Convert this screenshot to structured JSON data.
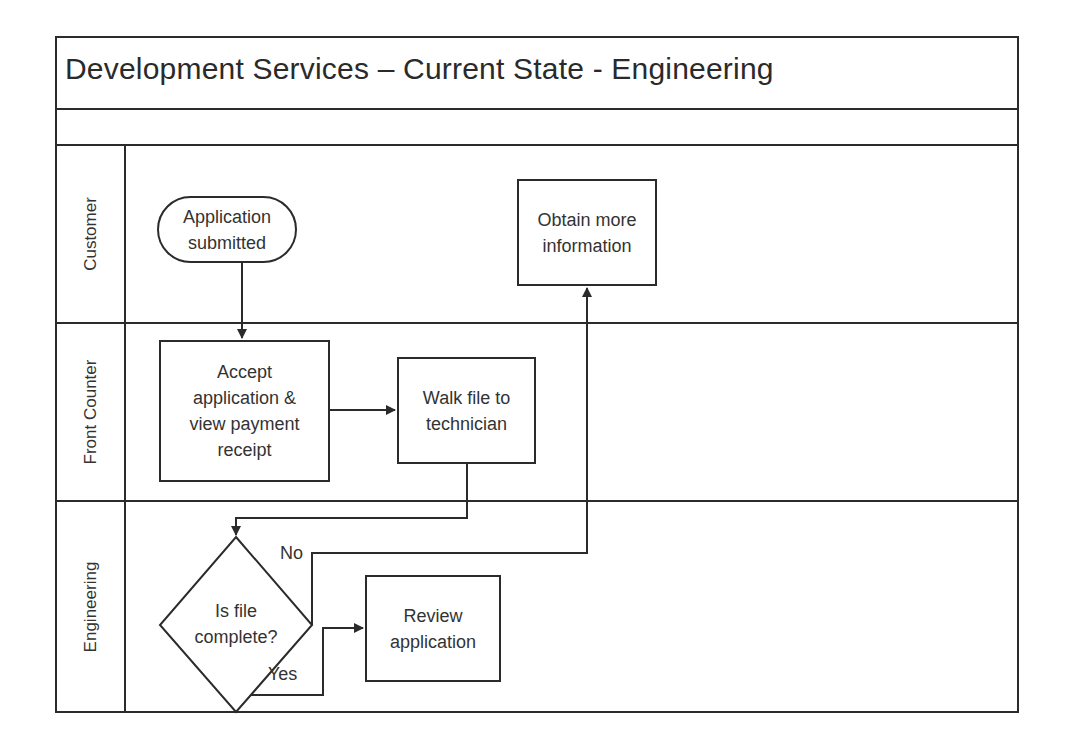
{
  "diagram": {
    "title": "Development Services – Current State - Engineering",
    "type": "swimlane-flowchart",
    "lanes": [
      {
        "id": "customer",
        "label": "Customer"
      },
      {
        "id": "front_counter",
        "label": "Front Counter"
      },
      {
        "id": "engineering",
        "label": "Engineering"
      }
    ],
    "nodes": {
      "start": {
        "lane": "customer",
        "shape": "terminator",
        "label": "Application\nsubmitted"
      },
      "accept": {
        "lane": "front_counter",
        "shape": "process",
        "label": "Accept\napplication &\nview payment\nreceipt"
      },
      "walk": {
        "lane": "front_counter",
        "shape": "process",
        "label": "Walk file to\ntechnician"
      },
      "decision": {
        "lane": "engineering",
        "shape": "decision",
        "label": "Is file\ncomplete?"
      },
      "obtain": {
        "lane": "customer",
        "shape": "process",
        "label": "Obtain more\ninformation"
      },
      "review": {
        "lane": "engineering",
        "shape": "process",
        "label": "Review\napplication"
      }
    },
    "edges": [
      {
        "from": "start",
        "to": "accept",
        "label": ""
      },
      {
        "from": "accept",
        "to": "walk",
        "label": ""
      },
      {
        "from": "walk",
        "to": "decision",
        "label": ""
      },
      {
        "from": "decision",
        "to": "obtain",
        "label": "No"
      },
      {
        "from": "decision",
        "to": "review",
        "label": "Yes"
      }
    ],
    "edge_labels": {
      "no": "No",
      "yes": "Yes"
    },
    "colors": {
      "stroke": "#2b2b2b",
      "text": "#333333",
      "background": "#ffffff"
    }
  }
}
